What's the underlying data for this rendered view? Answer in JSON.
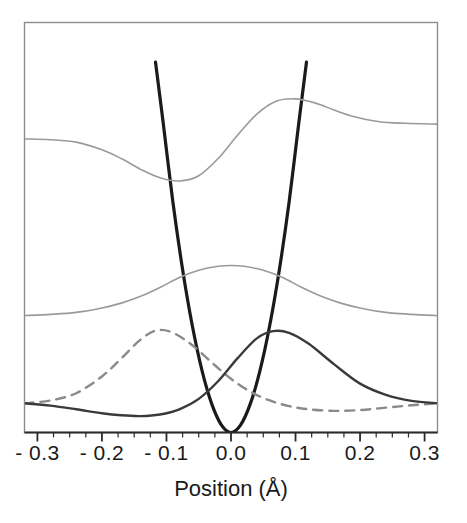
{
  "chart_data": {
    "type": "line",
    "title": "",
    "xlabel": "Position (Å)",
    "ylabel": "",
    "xlim": [
      -0.32,
      0.32
    ],
    "ylim": [
      0,
      1
    ],
    "grid": false,
    "legend": "none",
    "xticks": [
      "- 0.3",
      "- 0.2",
      "- 0.1",
      "0.0",
      "0.1",
      "0.2",
      "0.3"
    ],
    "xtick_values": [
      -0.3,
      -0.2,
      -0.1,
      0.0,
      0.1,
      0.2,
      0.3
    ],
    "xtick_minor_step": 0.025,
    "yticks": [],
    "series": [
      {
        "name": "potential-parabola",
        "style": "solid",
        "color": "#1a1a1a",
        "width": 3.2,
        "role": "harmonic potential well",
        "x": [
          -0.117,
          -0.105,
          -0.09,
          -0.075,
          -0.06,
          -0.045,
          -0.03,
          -0.015,
          0.0,
          0.015,
          0.03,
          0.045,
          0.06,
          0.075,
          0.09,
          0.105,
          0.117
        ],
        "values": [
          0.925,
          0.772,
          0.575,
          0.407,
          0.267,
          0.155,
          0.072,
          0.019,
          0.0,
          0.019,
          0.072,
          0.155,
          0.267,
          0.407,
          0.575,
          0.772,
          0.925
        ]
      },
      {
        "name": "excited-state-wavefunction",
        "style": "solid",
        "color": "#9a9a9a",
        "width": 1.6,
        "role": "upper antisymmetric eigenstate",
        "baseline": 0.731,
        "x": [
          -0.32,
          -0.28,
          -0.24,
          -0.2,
          -0.17,
          -0.14,
          -0.11,
          -0.08,
          -0.05,
          -0.02,
          0.01,
          0.04,
          0.07,
          0.1,
          0.13,
          0.16,
          0.19,
          0.23,
          0.27,
          0.32
        ],
        "values": [
          0.733,
          0.731,
          0.725,
          0.706,
          0.684,
          0.657,
          0.636,
          0.628,
          0.641,
          0.684,
          0.742,
          0.795,
          0.827,
          0.833,
          0.823,
          0.805,
          0.789,
          0.776,
          0.772,
          0.77
        ]
      },
      {
        "name": "ground-state-wavefunction",
        "style": "solid",
        "color": "#9a9a9a",
        "width": 1.6,
        "role": "lower symmetric eigenstate",
        "baseline": 0.292,
        "x": [
          -0.32,
          -0.28,
          -0.24,
          -0.2,
          -0.17,
          -0.14,
          -0.11,
          -0.08,
          -0.05,
          -0.02,
          0.0,
          0.02,
          0.05,
          0.08,
          0.11,
          0.14,
          0.17,
          0.2,
          0.24,
          0.28,
          0.32
        ],
        "values": [
          0.292,
          0.295,
          0.3,
          0.311,
          0.323,
          0.34,
          0.362,
          0.387,
          0.405,
          0.415,
          0.417,
          0.415,
          0.405,
          0.387,
          0.362,
          0.34,
          0.323,
          0.311,
          0.3,
          0.295,
          0.292
        ]
      },
      {
        "name": "left-localized-wavepacket",
        "style": "dashed",
        "color": "#8a8a8a",
        "width": 2.4,
        "role": "dashed localized state peaked left of center",
        "baseline": 0.073,
        "x": [
          -0.32,
          -0.28,
          -0.24,
          -0.2,
          -0.17,
          -0.14,
          -0.115,
          -0.09,
          -0.06,
          -0.03,
          0.0,
          0.03,
          0.06,
          0.09,
          0.12,
          0.16,
          0.2,
          0.24,
          0.28,
          0.32
        ],
        "values": [
          0.073,
          0.08,
          0.098,
          0.14,
          0.185,
          0.232,
          0.255,
          0.249,
          0.218,
          0.175,
          0.134,
          0.102,
          0.08,
          0.066,
          0.058,
          0.054,
          0.056,
          0.062,
          0.068,
          0.073
        ]
      },
      {
        "name": "right-localized-wavepacket",
        "style": "solid",
        "color": "#3a3a3a",
        "width": 2.4,
        "role": "solid localized state peaked right of center",
        "baseline": 0.073,
        "x": [
          -0.32,
          -0.28,
          -0.24,
          -0.2,
          -0.17,
          -0.14,
          -0.11,
          -0.08,
          -0.05,
          -0.02,
          0.01,
          0.04,
          0.065,
          0.09,
          0.12,
          0.16,
          0.2,
          0.24,
          0.28,
          0.32
        ],
        "values": [
          0.073,
          0.067,
          0.058,
          0.048,
          0.043,
          0.041,
          0.045,
          0.058,
          0.084,
          0.128,
          0.185,
          0.235,
          0.253,
          0.249,
          0.222,
          0.17,
          0.122,
          0.094,
          0.079,
          0.073
        ]
      }
    ]
  },
  "axis": {
    "xlabel": "Position (Å)",
    "ticks": [
      {
        "label": "- 0.3",
        "value": -0.3
      },
      {
        "label": "- 0.2",
        "value": -0.2
      },
      {
        "label": "- 0.1",
        "value": -0.1
      },
      {
        "label": "0.0",
        "value": 0.0
      },
      {
        "label": "0.1",
        "value": 0.1
      },
      {
        "label": "0.2",
        "value": 0.2
      },
      {
        "label": "0.3",
        "value": 0.3
      }
    ]
  },
  "colors": {
    "frame": "#8d8d8d",
    "axis": "#2a2a2a",
    "potential": "#1a1a1a",
    "eigenstate": "#9a9a9a",
    "packet_solid": "#3a3a3a",
    "packet_dashed": "#8a8a8a",
    "background": "#ffffff",
    "text": "#1a1a1a"
  }
}
